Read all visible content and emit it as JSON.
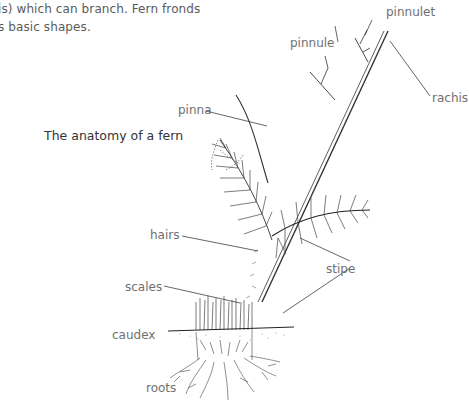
{
  "intro_text": {
    "line1": "is) which can branch. Fern fronds",
    "line2": "s basic shapes."
  },
  "caption": "The anatomy of a fern",
  "labels": {
    "pinnulet": "pinnulet",
    "pinnule": "pinnule",
    "rachis": "rachis",
    "pinna": "pinna",
    "hairs": "hairs",
    "stipe": "stipe",
    "scales": "scales",
    "caudex": "caudex",
    "roots": "roots"
  },
  "colors": {
    "ink": "#333333",
    "label_text": "#707070",
    "leader_line": "#555555"
  }
}
